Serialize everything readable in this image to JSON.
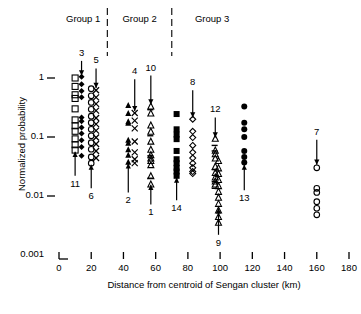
{
  "chart_data": {
    "type": "scatter",
    "title": "",
    "xlabel": "Distance from centroid of Sengan cluster (km)",
    "ylabel": "Normalized probability",
    "xlim": [
      0,
      180
    ],
    "ylim": [
      0.001,
      2.2
    ],
    "yscale": "log",
    "xticks": [
      0,
      20,
      40,
      60,
      80,
      100,
      120,
      140,
      160,
      180
    ],
    "xticklabels": [
      "0",
      "20",
      "40",
      "60",
      "80",
      "100",
      "120",
      "140",
      "160",
      "180"
    ],
    "yticks": [
      1,
      0.1,
      0.01,
      0.001
    ],
    "yticklabels": [
      "1",
      "0.1",
      "0.01",
      "0.001"
    ],
    "grid": false,
    "legend": "none",
    "group_labels": [
      "Group 1",
      "Group 2",
      "Group 3"
    ],
    "group_dividers_km": [
      30,
      70
    ],
    "series": [
      {
        "name": "11",
        "marker": "open-square",
        "x": 10,
        "values": [
          1.0,
          0.72,
          0.52,
          0.45,
          0.3,
          0.195,
          0.155,
          0.125,
          0.093,
          0.074,
          0.06
        ]
      },
      {
        "name": "3",
        "marker": "filled-diamond",
        "x": 14,
        "values": [
          1.05,
          0.78,
          0.6,
          0.47,
          0.215,
          0.185,
          0.145,
          0.115,
          0.088,
          0.068,
          0.048
        ]
      },
      {
        "name": "6",
        "marker": "open-circle",
        "x": 20,
        "values": [
          0.66,
          0.5,
          0.385,
          0.295,
          0.225,
          0.175,
          0.135,
          0.105,
          0.08,
          0.062,
          0.046,
          0.036
        ]
      },
      {
        "name": "5",
        "marker": "cross",
        "x": 23,
        "values": [
          0.62,
          0.47,
          0.365,
          0.28,
          0.21,
          0.165,
          0.128,
          0.098,
          0.076,
          0.058,
          0.044
        ]
      },
      {
        "name": "2",
        "marker": "filled-triangle",
        "x": 43,
        "values": [
          0.35,
          0.255,
          0.185,
          0.175,
          0.09,
          0.08,
          0.062,
          0.05,
          0.038
        ]
      },
      {
        "name": "4",
        "marker": "cross",
        "x": 47,
        "values": [
          0.255,
          0.19,
          0.14,
          0.084,
          0.055,
          0.042,
          0.036
        ]
      },
      {
        "name": "1",
        "marker": "open-triangle",
        "x": 57,
        "values": [
          0.335,
          0.255,
          0.16,
          0.125,
          0.085,
          0.062,
          0.05,
          0.044,
          0.04,
          0.034,
          0.022,
          0.016
        ]
      },
      {
        "name": "14",
        "marker": "filled-square",
        "x": 73,
        "values": [
          0.245,
          0.135,
          0.11,
          0.092,
          0.058,
          0.042,
          0.036,
          0.03,
          0.026,
          0.022
        ]
      },
      {
        "name": "8",
        "marker": "open-diamond",
        "x": 83,
        "values": [
          0.2,
          0.125,
          0.098,
          0.072,
          0.055,
          0.044,
          0.036,
          0.03,
          0.026,
          0.024
        ]
      },
      {
        "name": "12",
        "marker": "open-triangle",
        "x": 97,
        "values": [
          0.095,
          0.06,
          0.052,
          0.044,
          0.032,
          0.025,
          0.021,
          0.018,
          0.016
        ]
      },
      {
        "name": "9",
        "marker": "open-triangle",
        "x": 99,
        "values": [
          0.04,
          0.03,
          0.024,
          0.019,
          0.015,
          0.012,
          0.0095,
          0.0075,
          0.0058,
          0.0045,
          0.0036
        ]
      },
      {
        "name": "13",
        "marker": "filled-circle",
        "x": 115,
        "values": [
          0.33,
          0.175,
          0.135,
          0.1,
          0.058,
          0.046,
          0.037
        ]
      },
      {
        "name": "7",
        "marker": "open-circle",
        "x": 160,
        "values": [
          0.03,
          0.0135,
          0.0115,
          0.008,
          0.0062,
          0.0048
        ]
      }
    ],
    "annotations": [
      {
        "label": "3",
        "x": 14,
        "dir": "down",
        "tip": 1.1,
        "tail": 1.95
      },
      {
        "label": "5",
        "x": 23,
        "dir": "down",
        "tip": 0.68,
        "tail": 1.45
      },
      {
        "label": "4",
        "x": 47,
        "dir": "down",
        "tip": 0.275,
        "tail": 0.95
      },
      {
        "label": "10",
        "x": 57,
        "dir": "down",
        "tip": 0.355,
        "tail": 1.1
      },
      {
        "label": "8",
        "x": 83,
        "dir": "down",
        "tip": 0.215,
        "tail": 0.62
      },
      {
        "label": "12",
        "x": 97,
        "dir": "down",
        "tip": 0.098,
        "tail": 0.215
      },
      {
        "label": "7",
        "x": 160,
        "dir": "down",
        "tip": 0.034,
        "tail": 0.09
      },
      {
        "label": "11",
        "x": 10,
        "dir": "up",
        "tip": 0.056,
        "tail": 0.022
      },
      {
        "label": "6",
        "x": 20,
        "dir": "up",
        "tip": 0.034,
        "tail": 0.0135
      },
      {
        "label": "2",
        "x": 43,
        "dir": "up",
        "tip": 0.036,
        "tail": 0.0115
      },
      {
        "label": "1",
        "x": 57,
        "dir": "up",
        "tip": 0.0155,
        "tail": 0.0072
      },
      {
        "label": "14",
        "x": 73,
        "dir": "up",
        "tip": 0.0205,
        "tail": 0.0085
      },
      {
        "label": "13",
        "x": 115,
        "dir": "up",
        "tip": 0.034,
        "tail": 0.0125
      },
      {
        "label": "9",
        "x": 99,
        "dir": "up",
        "tip": 0.0062,
        "tail": 0.0022
      }
    ]
  }
}
